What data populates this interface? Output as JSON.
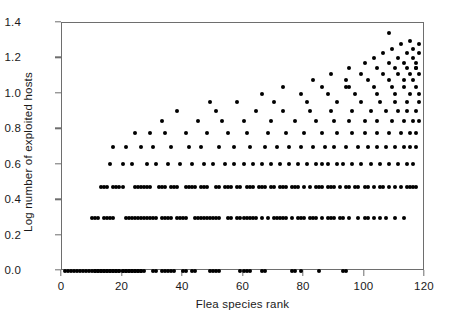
{
  "chart_data": {
    "type": "scatter",
    "title": "",
    "xlabel": "Flea species rank",
    "ylabel": "Log number of exploited hosts",
    "xlim": [
      0,
      120
    ],
    "ylim": [
      0.0,
      1.4
    ],
    "xticks": [
      0,
      20,
      40,
      60,
      80,
      100,
      120
    ],
    "xticklabels": [
      "0",
      "20",
      "40",
      "60",
      "80",
      "100",
      "120"
    ],
    "yticks": [
      0.0,
      0.2,
      0.4,
      0.6,
      0.8,
      1.0,
      1.2,
      1.4
    ],
    "yticklabels": [
      "0.0",
      "0.2",
      "0.4",
      "0.6",
      "0.8",
      "1.0",
      "1.2",
      "1.4"
    ],
    "grid": false,
    "legend": null,
    "marker": "filled-circle",
    "marker_color": "#000000",
    "marker_size_px": 4,
    "note": "Values are log10 of integer host counts, so points fall on discrete horizontal bands: 0.000(1), 0.301(2), 0.477(3), 0.602(4), 0.699(5), 0.778(6), 0.845(7), 0.903(8), 0.954(9), 1.000(10), 1.041(11), 1.079(12), 1.114(13), 1.146(14), 1.176(15), 1.204(16), 1.230(17), 1.255(18), 1.279(19), 1.301(20), 1.342(22)",
    "x": [
      1,
      2,
      3,
      4,
      5,
      6,
      7,
      8,
      9,
      10,
      11,
      12,
      13,
      14,
      15,
      16,
      17,
      18,
      19,
      20,
      21,
      22,
      23,
      24,
      25,
      26,
      27,
      11,
      12,
      13,
      14,
      15,
      16,
      17,
      18,
      19,
      20,
      21,
      22,
      23,
      24,
      25,
      26,
      30,
      31,
      33,
      34,
      35,
      36,
      37,
      40,
      41,
      43,
      44,
      49,
      50,
      51,
      52,
      59,
      60,
      61,
      62,
      66,
      67,
      76,
      77,
      79,
      85,
      93,
      94,
      10,
      11,
      12,
      14,
      15,
      16,
      17,
      21,
      22,
      23,
      24,
      25,
      26,
      27,
      28,
      29,
      30,
      31,
      33,
      34,
      35,
      36,
      38,
      39,
      40,
      41,
      44,
      45,
      46,
      47,
      48,
      49,
      50,
      51,
      52,
      55,
      56,
      58,
      59,
      60,
      61,
      62,
      63,
      64,
      66,
      68,
      70,
      71,
      72,
      73,
      74,
      76,
      78,
      79,
      80,
      82,
      83,
      84,
      86,
      88,
      89,
      90,
      92,
      93,
      95,
      98,
      100,
      101,
      103,
      105,
      107,
      110,
      113,
      13,
      14,
      15,
      17,
      18,
      19,
      20,
      24,
      25,
      26,
      27,
      28,
      29,
      32,
      33,
      34,
      36,
      37,
      38,
      41,
      42,
      43,
      44,
      46,
      47,
      48,
      51,
      52,
      54,
      55,
      56,
      58,
      59,
      61,
      62,
      63,
      65,
      66,
      67,
      69,
      70,
      72,
      73,
      74,
      76,
      77,
      78,
      80,
      82,
      84,
      85,
      86,
      88,
      89,
      90,
      92,
      94,
      95,
      97,
      98,
      100,
      101,
      103,
      105,
      106,
      108,
      110,
      112,
      114,
      115,
      116,
      117,
      16,
      20,
      23,
      28,
      31,
      35,
      39,
      43,
      47,
      50,
      54,
      57,
      60,
      63,
      66,
      69,
      72,
      75,
      78,
      81,
      84,
      86,
      88,
      91,
      93,
      96,
      99,
      102,
      105,
      108,
      111,
      114,
      116,
      17,
      21,
      26,
      30,
      36,
      42,
      46,
      52,
      57,
      62,
      67,
      71,
      75,
      79,
      83,
      87,
      90,
      94,
      98,
      101,
      104,
      107,
      110,
      113,
      115,
      117,
      24,
      29,
      34,
      41,
      48,
      55,
      61,
      68,
      74,
      80,
      86,
      91,
      96,
      100,
      104,
      108,
      112,
      115,
      117,
      33,
      45,
      53,
      60,
      69,
      77,
      84,
      90,
      95,
      100,
      104,
      109,
      113,
      116,
      118,
      38,
      51,
      64,
      73,
      82,
      89,
      96,
      102,
      107,
      111,
      114,
      117,
      49,
      58,
      70,
      81,
      91,
      99,
      105,
      110,
      114,
      118,
      66,
      79,
      88,
      97,
      104,
      110,
      115,
      118,
      73,
      86,
      95,
      103,
      109,
      113,
      117,
      83,
      94,
      101,
      108,
      113,
      116,
      89,
      99,
      106,
      111,
      115,
      118,
      95,
      104,
      110,
      114,
      117,
      100,
      108,
      113,
      117,
      103,
      111,
      116,
      106,
      114,
      118,
      109,
      116,
      112,
      118,
      115,
      94,
      117,
      108
    ],
    "y": [
      0.0,
      0.0,
      0.0,
      0.0,
      0.0,
      0.0,
      0.0,
      0.0,
      0.0,
      0.0,
      0.0,
      0.0,
      0.0,
      0.0,
      0.0,
      0.0,
      0.0,
      0.0,
      0.0,
      0.0,
      0.0,
      0.0,
      0.0,
      0.0,
      0.0,
      0.0,
      0.0,
      0.0,
      0.0,
      0.0,
      0.0,
      0.0,
      0.0,
      0.0,
      0.0,
      0.0,
      0.0,
      0.0,
      0.0,
      0.0,
      0.0,
      0.0,
      0.0,
      0.0,
      0.0,
      0.0,
      0.0,
      0.0,
      0.0,
      0.0,
      0.0,
      0.0,
      0.0,
      0.0,
      0.0,
      0.0,
      0.0,
      0.0,
      0.0,
      0.0,
      0.0,
      0.0,
      0.0,
      0.0,
      0.0,
      0.0,
      0.0,
      0.0,
      0.0,
      0.0,
      0.301,
      0.301,
      0.301,
      0.301,
      0.301,
      0.301,
      0.301,
      0.301,
      0.301,
      0.301,
      0.301,
      0.301,
      0.301,
      0.301,
      0.301,
      0.301,
      0.301,
      0.301,
      0.301,
      0.301,
      0.301,
      0.301,
      0.301,
      0.301,
      0.301,
      0.301,
      0.301,
      0.301,
      0.301,
      0.301,
      0.301,
      0.301,
      0.301,
      0.301,
      0.301,
      0.301,
      0.301,
      0.301,
      0.301,
      0.301,
      0.301,
      0.301,
      0.301,
      0.301,
      0.301,
      0.301,
      0.301,
      0.301,
      0.301,
      0.301,
      0.301,
      0.301,
      0.301,
      0.301,
      0.301,
      0.301,
      0.301,
      0.301,
      0.301,
      0.301,
      0.301,
      0.301,
      0.301,
      0.301,
      0.301,
      0.301,
      0.301,
      0.301,
      0.301,
      0.301,
      0.301,
      0.301,
      0.301,
      0.477,
      0.477,
      0.477,
      0.477,
      0.477,
      0.477,
      0.477,
      0.477,
      0.477,
      0.477,
      0.477,
      0.477,
      0.477,
      0.477,
      0.477,
      0.477,
      0.477,
      0.477,
      0.477,
      0.477,
      0.477,
      0.477,
      0.477,
      0.477,
      0.477,
      0.477,
      0.477,
      0.477,
      0.477,
      0.477,
      0.477,
      0.477,
      0.477,
      0.477,
      0.477,
      0.477,
      0.477,
      0.477,
      0.477,
      0.477,
      0.477,
      0.477,
      0.477,
      0.477,
      0.477,
      0.477,
      0.477,
      0.477,
      0.477,
      0.477,
      0.477,
      0.477,
      0.477,
      0.477,
      0.477,
      0.477,
      0.477,
      0.477,
      0.477,
      0.477,
      0.477,
      0.477,
      0.477,
      0.477,
      0.477,
      0.477,
      0.477,
      0.477,
      0.477,
      0.477,
      0.477,
      0.477,
      0.602,
      0.602,
      0.602,
      0.602,
      0.602,
      0.602,
      0.602,
      0.602,
      0.602,
      0.602,
      0.602,
      0.602,
      0.602,
      0.602,
      0.602,
      0.602,
      0.602,
      0.602,
      0.602,
      0.602,
      0.602,
      0.602,
      0.602,
      0.602,
      0.602,
      0.602,
      0.602,
      0.602,
      0.602,
      0.602,
      0.602,
      0.602,
      0.602,
      0.699,
      0.699,
      0.699,
      0.699,
      0.699,
      0.699,
      0.699,
      0.699,
      0.699,
      0.699,
      0.699,
      0.699,
      0.699,
      0.699,
      0.699,
      0.699,
      0.699,
      0.699,
      0.699,
      0.699,
      0.699,
      0.699,
      0.699,
      0.699,
      0.699,
      0.699,
      0.778,
      0.778,
      0.778,
      0.778,
      0.778,
      0.778,
      0.778,
      0.778,
      0.778,
      0.778,
      0.778,
      0.778,
      0.778,
      0.778,
      0.778,
      0.778,
      0.778,
      0.778,
      0.778,
      0.845,
      0.845,
      0.845,
      0.845,
      0.845,
      0.845,
      0.845,
      0.845,
      0.845,
      0.845,
      0.845,
      0.845,
      0.845,
      0.845,
      0.845,
      0.903,
      0.903,
      0.903,
      0.903,
      0.903,
      0.903,
      0.903,
      0.903,
      0.903,
      0.903,
      0.903,
      0.903,
      0.954,
      0.954,
      0.954,
      0.954,
      0.954,
      0.954,
      0.954,
      0.954,
      0.954,
      0.954,
      1.0,
      1.0,
      1.0,
      1.0,
      1.0,
      1.0,
      1.0,
      1.0,
      1.041,
      1.041,
      1.041,
      1.041,
      1.041,
      1.041,
      1.041,
      1.079,
      1.079,
      1.079,
      1.079,
      1.079,
      1.079,
      1.114,
      1.114,
      1.114,
      1.114,
      1.114,
      1.114,
      1.146,
      1.146,
      1.146,
      1.146,
      1.146,
      1.176,
      1.176,
      1.176,
      1.176,
      1.204,
      1.204,
      1.204,
      1.23,
      1.23,
      1.23,
      1.255,
      1.255,
      1.279,
      1.279,
      1.301,
      1.041,
      1.146,
      1.342
    ]
  }
}
